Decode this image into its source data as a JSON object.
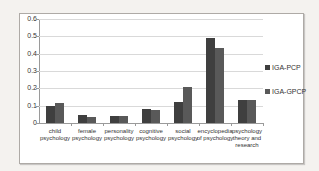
{
  "page": {
    "background_color": "#f4f2ef"
  },
  "chart": {
    "frame_border_color": "#aeaaa6",
    "plot_background": "#ffffff",
    "grid_color": "#d9d9d9",
    "axis_color": "#9a9a9a",
    "text_color": "#333333"
  },
  "chart_data": {
    "type": "bar",
    "title": "",
    "xlabel": "",
    "ylabel": "",
    "categories": [
      "child psychology",
      "female psychology",
      "personality psychology",
      "cognitive psychology",
      "social psychology",
      "encyclopedia of psychology",
      "psychology theory and research"
    ],
    "series": [
      {
        "name": "IGA-PCP",
        "color": "#3f3f3f",
        "values": [
          0.1,
          0.045,
          0.04,
          0.08,
          0.12,
          0.49,
          0.135
        ]
      },
      {
        "name": "IGA-GPCP",
        "color": "#595959",
        "values": [
          0.115,
          0.035,
          0.04,
          0.075,
          0.21,
          0.43,
          0.13
        ]
      }
    ],
    "ylim": [
      0,
      0.6
    ],
    "yticks": [
      0,
      0.1,
      0.2,
      0.3,
      0.4,
      0.5,
      0.6
    ],
    "grid": true,
    "legend_position": "right-outside"
  }
}
